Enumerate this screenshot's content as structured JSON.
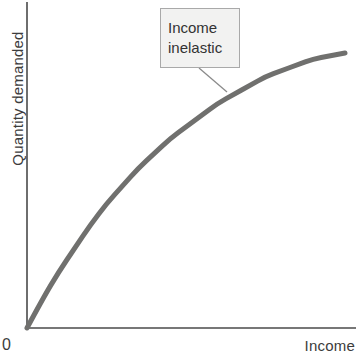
{
  "chart_data": {
    "type": "line",
    "title": "",
    "xlabel": "Income",
    "ylabel": "Quantity demanded",
    "origin_label": "0",
    "grid": false,
    "legend": null,
    "xlim": [
      0,
      100
    ],
    "ylim": [
      0,
      100
    ],
    "x_ticks": [],
    "y_ticks": [],
    "series": [
      {
        "name": "Income inelastic demand curve",
        "color": "#70706e",
        "line_width": 5,
        "x": [
          0,
          5,
          10,
          15,
          20,
          25,
          30,
          35,
          40,
          45,
          50,
          55,
          60,
          65,
          70,
          75,
          80,
          85,
          90,
          95,
          100
        ],
        "y": [
          0,
          10,
          19,
          27,
          35,
          42,
          48,
          54,
          59,
          64,
          68,
          72,
          76,
          79,
          82,
          85,
          87,
          89,
          91,
          92,
          93
        ]
      }
    ],
    "annotations": [
      {
        "text_lines": [
          "Income",
          "inelastic"
        ],
        "target_x": 62,
        "target_y": 74,
        "box_fill": "#f2f2f1",
        "box_border": "#a9a9a9",
        "leader_color": "#8a8a8a"
      }
    ],
    "colors": {
      "axis": "#4a4a4a",
      "curve": "#70706e",
      "text": "#3c3c3c",
      "background": "#ffffff"
    }
  },
  "labels": {
    "y_axis": "Quantity demanded",
    "x_axis": "Income",
    "origin": "0",
    "callout_line_1": "Income",
    "callout_line_2": "inelastic"
  }
}
